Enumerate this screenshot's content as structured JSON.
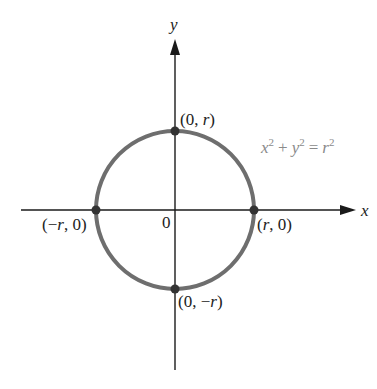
{
  "diagram": {
    "axes": {
      "x_label": "x",
      "y_label": "y",
      "origin_label": "0"
    },
    "equation": {
      "text": "x² + y² = r²",
      "x": "x",
      "y": "y",
      "r": "r",
      "exp": "2",
      "plus": "+",
      "eq": "="
    },
    "points": [
      {
        "label": "(0, r)",
        "pre": "(0, ",
        "var": "r",
        "post": ")"
      },
      {
        "label": "(r, 0)",
        "pre": "(",
        "var": "r",
        "post": ", 0)"
      },
      {
        "label": "(−r, 0)",
        "pre": "(−",
        "var": "r",
        "post": ", 0)"
      },
      {
        "label": "(0, −r)",
        "pre": "(0, −",
        "var": "r",
        "post": ")"
      }
    ],
    "colors": {
      "axis": "#1a1a1a",
      "circle": "#6e6e6e",
      "point": "#333333",
      "equation": "#8a8a8a"
    }
  }
}
